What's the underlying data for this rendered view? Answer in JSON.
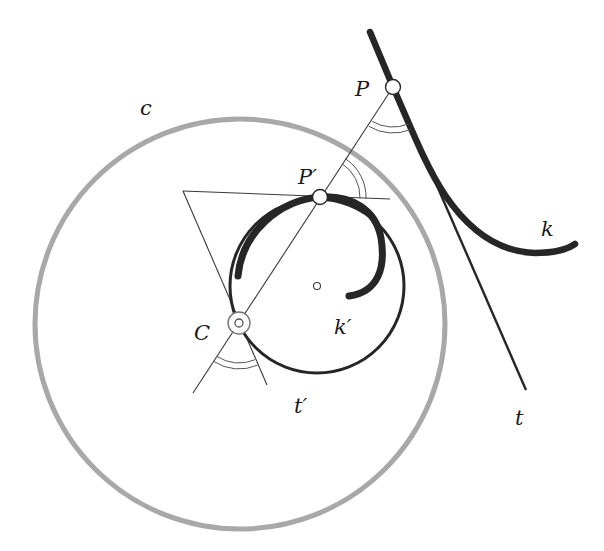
{
  "figure": {
    "type": "geometric-construction",
    "colors": {
      "ink": "#262626",
      "thin_line": "#3a3a3a",
      "inversion_circle": "#a8a8a8",
      "background": "#ffffff"
    },
    "labels": {
      "c": "c",
      "P": "P",
      "P_prime": "P′",
      "k": "k",
      "k_prime": "k′",
      "C": "C",
      "t_prime": "t′",
      "t": "t"
    },
    "points": {
      "C": {
        "x": 239,
        "y": 323
      },
      "P": {
        "x": 393,
        "y": 87
      },
      "P_prime": {
        "x": 320,
        "y": 197
      },
      "t_prime_center": {
        "x": 317,
        "y": 286
      }
    },
    "circles": {
      "c": {
        "cx": 240,
        "cy": 324,
        "r": 205
      },
      "t_prime": {
        "cx": 317,
        "cy": 286,
        "r": 87
      }
    }
  }
}
